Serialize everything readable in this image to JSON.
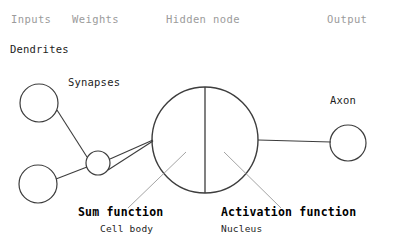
{
  "diagram": {
    "title_row": {
      "inputs": "Inputs",
      "weights": "Weights",
      "hidden_node": "Hidden node",
      "output": "Output"
    },
    "annotations": {
      "dendrites": "Dendrites",
      "synapses": "Synapses",
      "axon": "Axon"
    },
    "captions": {
      "sum_function": "Sum function",
      "cell_body": "Cell body",
      "activation_function": "Activation function",
      "nucleus": "Nucleus"
    },
    "colors": {
      "background": "#ffffff",
      "stroke": "#3d3d3d",
      "leader_line": "#9a9a9a",
      "header_text": "#9b9b9b",
      "body_text": "#1d1d1d"
    },
    "shapes": {
      "input_node_top": {
        "cx": 39,
        "cy": 103,
        "r": 19
      },
      "input_node_bottom": {
        "cx": 38,
        "cy": 184,
        "r": 19
      },
      "synapse_node": {
        "cx": 98,
        "cy": 163,
        "r": 12
      },
      "soma": {
        "cx": 205,
        "cy": 140,
        "r": 53
      },
      "output_node": {
        "cx": 348,
        "cy": 143,
        "r": 18
      },
      "divider_line": {
        "x": 205,
        "y1": 87,
        "y2": 193
      },
      "axon_line": {
        "x1": 258,
        "y1": 140,
        "x2": 330,
        "y2": 142
      }
    }
  }
}
